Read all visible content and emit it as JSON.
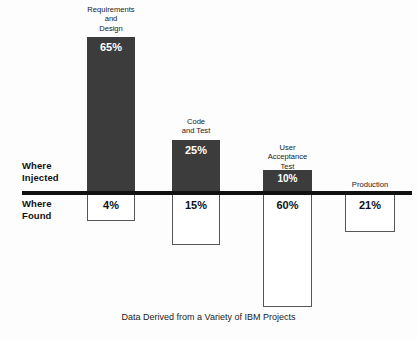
{
  "chart_data": {
    "type": "bar",
    "title": "",
    "subtitle": "",
    "caption": "Data Derived from a Variety of IBM Projects",
    "orientation": "vertical-diverging",
    "xlabel": "",
    "ylabel": "",
    "grid": false,
    "legend_position": "none",
    "axis_baseline_label_above": "Where Injected",
    "axis_baseline_label_below": "Where Found",
    "categories": [
      "Requirements and Design",
      "Code and Test",
      "User Acceptance Test",
      "Production"
    ],
    "series": [
      {
        "name": "Where Injected",
        "direction": "up",
        "values": [
          65,
          25,
          10,
          0
        ],
        "value_labels": [
          "65%",
          "25%",
          "10%",
          ""
        ],
        "color": "#3c3c3c"
      },
      {
        "name": "Where Found",
        "direction": "down",
        "values": [
          4,
          15,
          60,
          21
        ],
        "value_labels": [
          "4%",
          "15%",
          "60%",
          "21%"
        ],
        "color": "#ffffff"
      }
    ],
    "ylim": [
      -60,
      65
    ],
    "units": "percent"
  },
  "axis": {
    "injected_label": "Where Injected",
    "found_label": "Where Found"
  },
  "columns": [
    {
      "id": "requirements-and-design",
      "label_lines": [
        "Requirements",
        "and",
        "Design"
      ],
      "injected_value": "65%",
      "found_value": "4%"
    },
    {
      "id": "code-and-test",
      "label_lines": [
        "Code",
        "and Test"
      ],
      "injected_value": "25%",
      "found_value": "15%"
    },
    {
      "id": "user-acceptance-test",
      "label_lines": [
        "User",
        "Acceptance",
        "Test"
      ],
      "injected_value": "10%",
      "found_value": "60%"
    },
    {
      "id": "production",
      "label_lines": [
        "Production"
      ],
      "injected_value": "",
      "found_value": "21%"
    }
  ],
  "labels": {
    "req_line1": "Requirements",
    "req_line2": "and",
    "req_line3": "Design",
    "code_line1": "Code",
    "code_line2": "and Test",
    "uat_line1": "User",
    "uat_line2": "Acceptance",
    "uat_line3": "Test",
    "prod_line1": "Production"
  },
  "values": {
    "req_injected": "65%",
    "req_found": "4%",
    "code_injected": "25%",
    "code_found": "15%",
    "uat_injected": "10%",
    "uat_found": "60%",
    "prod_found": "21%"
  },
  "caption": "Data Derived from a Variety of IBM Projects",
  "colors": {
    "bar_fill": "#3c3c3c",
    "bar_outline": "#565656",
    "axis": "#111111",
    "background": "#fdfdfd",
    "text": "#1a1a1a"
  }
}
